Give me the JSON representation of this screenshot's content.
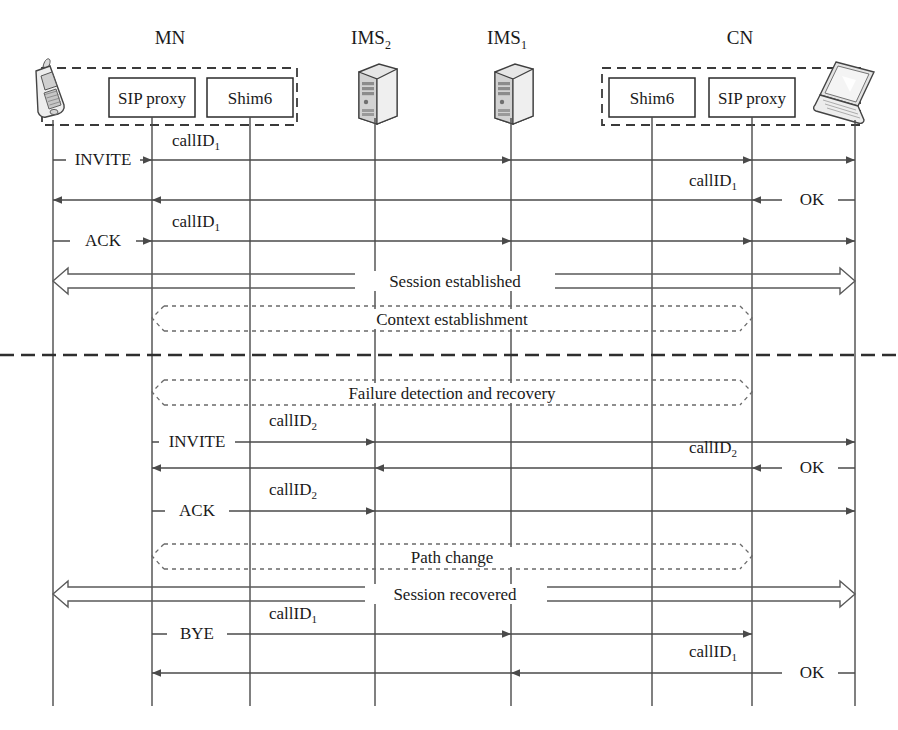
{
  "figure": {
    "type": "sequence-diagram"
  },
  "actors": [
    {
      "id": "mn-device",
      "label": "",
      "icon": "mobile-phone-icon",
      "x": 53,
      "group": "MN"
    },
    {
      "id": "mn-sip",
      "label": "SIP proxy",
      "icon": "",
      "x": 152,
      "group": "MN"
    },
    {
      "id": "mn-shim6",
      "label": "Shim6",
      "icon": "",
      "x": 250,
      "group": "MN"
    },
    {
      "id": "ims2",
      "label": "",
      "icon": "server-icon",
      "x": 375,
      "group": "IMS2"
    },
    {
      "id": "ims1",
      "label": "",
      "icon": "server-icon",
      "x": 511,
      "group": "IMS1"
    },
    {
      "id": "cn-shim6",
      "label": "Shim6",
      "icon": "",
      "x": 652,
      "group": "CN"
    },
    {
      "id": "cn-sip",
      "label": "SIP proxy",
      "icon": "",
      "x": 752,
      "group": "CN"
    },
    {
      "id": "cn-device",
      "label": "",
      "icon": "laptop-icon",
      "x": 855,
      "group": "CN"
    }
  ],
  "groups": [
    {
      "id": "mn",
      "title": "MN",
      "title_sub": "",
      "x": 170
    },
    {
      "id": "ims2",
      "title": "IMS",
      "title_sub": "2",
      "x": 375
    },
    {
      "id": "ims1",
      "title": "IMS",
      "title_sub": "1",
      "x": 511
    },
    {
      "id": "cn",
      "title": "CN",
      "title_sub": "",
      "x": 740
    }
  ],
  "messages": [
    {
      "id": "m1",
      "y": 160,
      "label": "INVITE",
      "label_x": 103,
      "sub": "",
      "id_label": "callID",
      "id_sub": "1",
      "id_x": 196,
      "id_y": 146,
      "from": 53,
      "to": 855,
      "dir": "right",
      "ticks": [
        152,
        511,
        752,
        855
      ]
    },
    {
      "id": "m2",
      "y": 200,
      "label": "OK",
      "label_x": 813,
      "sub": "",
      "id_label": "callID",
      "id_sub": "1",
      "id_x": 713,
      "id_y": 186,
      "from": 855,
      "to": 53,
      "dir": "left",
      "ticks": [
        752,
        152,
        53
      ]
    },
    {
      "id": "m3",
      "y": 241,
      "label": "ACK",
      "label_x": 103,
      "sub": "",
      "id_label": "callID",
      "id_sub": "1",
      "id_x": 196,
      "id_y": 227,
      "from": 53,
      "to": 855,
      "dir": "right",
      "ticks": [
        152,
        511,
        752,
        855
      ]
    },
    {
      "id": "m4",
      "y": 442,
      "label": "INVITE",
      "label_x": 196,
      "sub": "",
      "id_label": "callID",
      "id_sub": "2",
      "id_x": 293,
      "id_y": 425,
      "from": 152,
      "to": 855,
      "dir": "right",
      "ticks": [
        375,
        855
      ]
    },
    {
      "id": "m5",
      "y": 468,
      "label": "OK",
      "label_x": 812,
      "sub": "",
      "id_label": "callID",
      "id_sub": "2",
      "id_x": 713,
      "id_y": 452,
      "from": 855,
      "to": 152,
      "dir": "left",
      "ticks": [
        752,
        375,
        152
      ]
    },
    {
      "id": "m6",
      "y": 511,
      "label": "ACK",
      "label_x": 196,
      "sub": "",
      "id_label": "callID",
      "id_sub": "2",
      "id_x": 293,
      "id_y": 494,
      "from": 152,
      "to": 855,
      "dir": "right",
      "ticks": [
        375,
        855
      ]
    },
    {
      "id": "m7",
      "y": 634,
      "label": "BYE",
      "label_x": 196,
      "sub": "",
      "id_label": "callID",
      "id_sub": "1",
      "id_x": 293,
      "id_y": 618,
      "from": 152,
      "to": 752,
      "dir": "right",
      "ticks": [
        511,
        752
      ]
    },
    {
      "id": "m8",
      "y": 673,
      "label": "OK",
      "label_x": 812,
      "sub": "",
      "id_label": "callID",
      "id_sub": "1",
      "id_x": 713,
      "id_y": 656,
      "from": 855,
      "to": 152,
      "dir": "left",
      "ticks": [
        511,
        152
      ]
    }
  ],
  "spans": [
    {
      "id": "s1",
      "label": "Session established",
      "style": "solid",
      "y": 281,
      "from": 53,
      "to": 855,
      "x_center": 455
    },
    {
      "id": "s2",
      "label": "Context establishment",
      "style": "dashed",
      "y": 318,
      "from": 152,
      "to": 752,
      "x_center": 452
    },
    {
      "id": "s3",
      "label": "Failure detection and recovery",
      "style": "dashed",
      "y": 392,
      "from": 152,
      "to": 752,
      "x_center": 452
    },
    {
      "id": "s4",
      "label": "Path change",
      "style": "dashed",
      "y": 556,
      "from": 152,
      "to": 752,
      "x_center": 452
    },
    {
      "id": "s5",
      "label": "Session recovered",
      "style": "solid",
      "y": 594,
      "from": 53,
      "to": 855,
      "x_center": 455
    }
  ],
  "divider": {
    "id": "handover-divider",
    "y": 355,
    "from": 0,
    "to": 898
  },
  "colors": {
    "line": "#4a4a4a",
    "dashed": "#6a6a6a",
    "box_stroke": "#2b2b2b",
    "text": "#1a1a1a",
    "background": "#ffffff"
  }
}
